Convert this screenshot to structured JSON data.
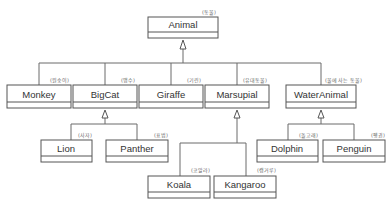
{
  "diagram": {
    "type": "uml-class-hierarchy",
    "classes": [
      {
        "id": "animal",
        "name": "Animal",
        "note": "(동물)"
      },
      {
        "id": "monkey",
        "name": "Monkey",
        "note": "(원숭이)",
        "parent": "animal"
      },
      {
        "id": "bigcat",
        "name": "BigCat",
        "note": "(맹수)",
        "parent": "animal"
      },
      {
        "id": "giraffe",
        "name": "Giraffe",
        "note": "(기린)",
        "parent": "animal"
      },
      {
        "id": "marsupial",
        "name": "Marsupial",
        "note": "(유대동물)",
        "parent": "animal"
      },
      {
        "id": "wateranimal",
        "name": "WaterAnimal",
        "note": "(물에 사는 동물)",
        "parent": "animal"
      },
      {
        "id": "lion",
        "name": "Lion",
        "note": "(사자)",
        "parent": "bigcat"
      },
      {
        "id": "panther",
        "name": "Panther",
        "note": "(표범)",
        "parent": "bigcat"
      },
      {
        "id": "koala",
        "name": "Koala",
        "note": "(코알라)",
        "parent": "marsupial"
      },
      {
        "id": "kangaroo",
        "name": "Kangaroo",
        "note": "(캥거루)",
        "parent": "marsupial"
      },
      {
        "id": "dolphin",
        "name": "Dolphin",
        "note": "(돌고래)",
        "parent": "wateranimal"
      },
      {
        "id": "penguin",
        "name": "Penguin",
        "note": "(펭귄)",
        "parent": "wateranimal"
      }
    ],
    "relationship": "generalization"
  }
}
